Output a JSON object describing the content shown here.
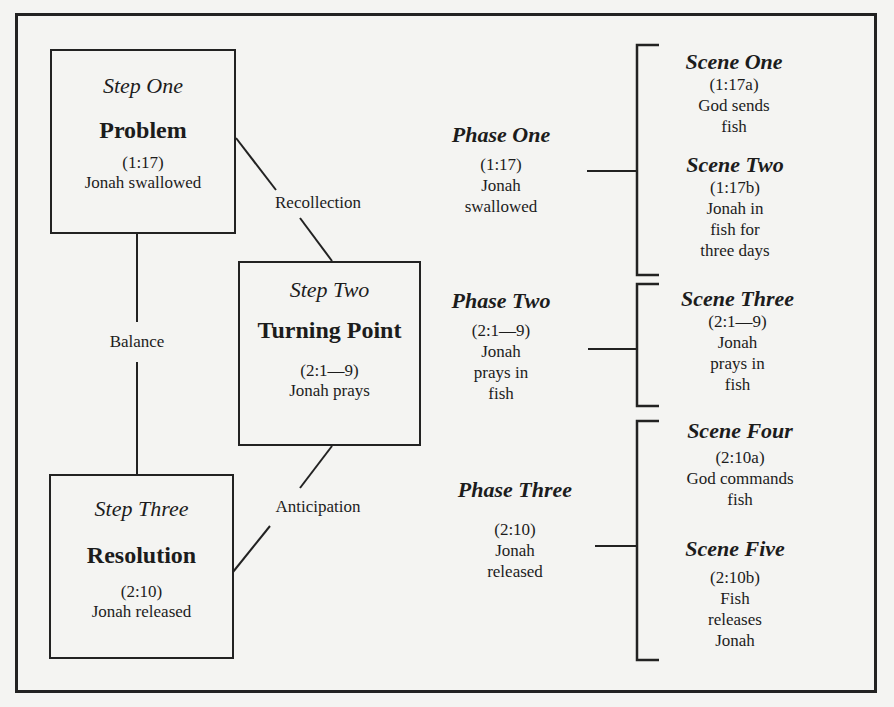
{
  "steps": [
    {
      "label": "Step One",
      "title": "Problem",
      "ref": "(1:17)",
      "desc": "Jonah swallowed"
    },
    {
      "label": "Step Two",
      "title": "Turning Point",
      "ref": "(2:1—9)",
      "desc": "Jonah prays"
    },
    {
      "label": "Step Three",
      "title": "Resolution",
      "ref": "(2:10)",
      "desc": "Jonah released"
    }
  ],
  "connectors": {
    "recollection": "Recollection",
    "balance": "Balance",
    "anticipation": "Anticipation"
  },
  "phases": [
    {
      "title": "Phase One",
      "ref": "(1:17)",
      "desc_lines": [
        "Jonah",
        "swallowed"
      ]
    },
    {
      "title": "Phase Two",
      "ref": "(2:1—9)",
      "desc_lines": [
        "Jonah",
        "prays in",
        "fish"
      ]
    },
    {
      "title": "Phase Three",
      "ref": "(2:10)",
      "desc_lines": [
        "Jonah",
        "released"
      ]
    }
  ],
  "scenes": [
    {
      "title": "Scene One",
      "ref": "(1:17a)",
      "desc_lines": [
        "God sends",
        "fish"
      ]
    },
    {
      "title": "Scene Two",
      "ref": "(1:17b)",
      "desc_lines": [
        "Jonah in",
        "fish for",
        "three days"
      ]
    },
    {
      "title": "Scene Three",
      "ref": "(2:1—9)",
      "desc_lines": [
        "Jonah",
        "prays in",
        "fish"
      ]
    },
    {
      "title": "Scene Four",
      "ref": "(2:10a)",
      "desc_lines": [
        "God commands",
        "fish"
      ]
    },
    {
      "title": "Scene Five",
      "ref": "(2:10b)",
      "desc_lines": [
        "Fish",
        "releases",
        "Jonah"
      ]
    }
  ]
}
